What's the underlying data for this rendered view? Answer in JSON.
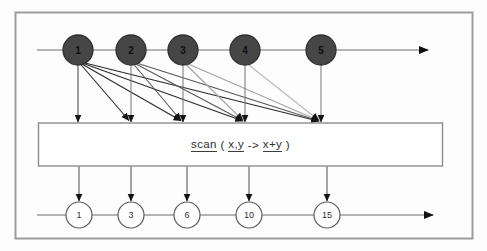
{
  "diagram_title": "scan operator marble diagram",
  "input_stream": {
    "values": [
      "1",
      "2",
      "3",
      "4",
      "5"
    ],
    "marble_fill": "#464646",
    "marble_stroke": "#2e2e2e"
  },
  "operator_box": {
    "tokens": [
      {
        "text": "scan",
        "underline": true
      },
      {
        "text": " ( ",
        "underline": false
      },
      {
        "text": "x,y",
        "underline": true
      },
      {
        "text": " -> ",
        "underline": false
      },
      {
        "text": "x+y",
        "underline": true
      },
      {
        "text": " )",
        "underline": false
      }
    ],
    "box_stroke": "#8c8c8c",
    "box_fill": "#ffffff"
  },
  "output_stream": {
    "values": [
      "1",
      "3",
      "6",
      "10",
      "15"
    ],
    "marble_fill": "#ffffff",
    "marble_stroke": "#5c5c5c"
  },
  "connections": {
    "fan_from_1_color": "#2b2b2b",
    "fan_from_2_color": "#585858",
    "fan_from_3_color": "#a3a3a3",
    "fan_from_4_color": "#b8b8b8",
    "vertical_color": "#757575",
    "output_arrow_color": "#4a4a4a",
    "timeline_color": "#6e6e6e",
    "arrowhead_color": "#141414"
  },
  "frame": {
    "border_color": "#9c9c9c"
  }
}
